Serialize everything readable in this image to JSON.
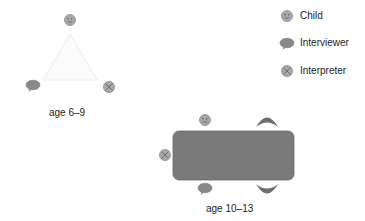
{
  "legend": {
    "items": [
      {
        "icon": "smiley-face-icon",
        "label": "Child"
      },
      {
        "icon": "speech-bubble-icon",
        "label": "Interviewer"
      },
      {
        "icon": "crossed-circle-icon",
        "label": "Interpreter"
      }
    ]
  },
  "arrangements": [
    {
      "caption": "age 6–9",
      "layout": "triangle"
    },
    {
      "caption": "age 10–13",
      "layout": "rectangular-table"
    }
  ],
  "colors": {
    "icon_fill": "#a8a8a8",
    "icon_stroke": "#8a8a8a",
    "table_fill": "#7a7a7a",
    "crescent_fill": "#6e6e6e",
    "triangle_stroke": "#ececec"
  }
}
